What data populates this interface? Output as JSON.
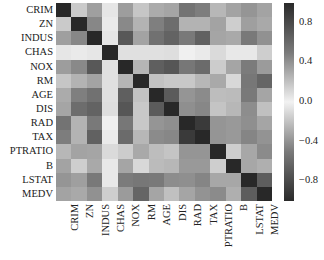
{
  "chart_data": {
    "type": "heatmap",
    "title": "",
    "xlabel": "",
    "ylabel": "",
    "labels": [
      "CRIM",
      "ZN",
      "INDUS",
      "CHAS",
      "NOX",
      "RM",
      "AGE",
      "DIS",
      "RAD",
      "TAX",
      "PTRATIO",
      "B",
      "LSTAT",
      "MEDV"
    ],
    "matrix": [
      [
        1.0,
        -0.2,
        0.41,
        -0.06,
        0.42,
        -0.22,
        0.35,
        -0.38,
        0.63,
        0.58,
        0.29,
        -0.39,
        0.46,
        -0.39
      ],
      [
        -0.2,
        1.0,
        -0.53,
        -0.04,
        -0.52,
        0.31,
        -0.57,
        0.66,
        -0.31,
        -0.31,
        -0.39,
        0.18,
        -0.41,
        0.36
      ],
      [
        0.41,
        -0.53,
        1.0,
        0.06,
        0.76,
        -0.39,
        0.64,
        -0.71,
        0.6,
        0.72,
        0.38,
        -0.36,
        0.6,
        -0.48
      ],
      [
        -0.06,
        -0.04,
        0.06,
        1.0,
        0.09,
        0.09,
        0.09,
        -0.1,
        -0.01,
        -0.04,
        -0.12,
        0.05,
        -0.05,
        0.18
      ],
      [
        0.42,
        -0.52,
        0.76,
        0.09,
        1.0,
        -0.3,
        0.73,
        -0.77,
        0.61,
        0.67,
        0.19,
        -0.38,
        0.59,
        -0.43
      ],
      [
        -0.22,
        0.31,
        -0.39,
        0.09,
        -0.3,
        1.0,
        -0.24,
        0.21,
        -0.21,
        -0.29,
        -0.36,
        0.13,
        -0.61,
        0.7
      ],
      [
        0.35,
        -0.57,
        0.64,
        0.09,
        0.73,
        -0.24,
        1.0,
        -0.75,
        0.46,
        0.51,
        0.26,
        -0.27,
        0.6,
        -0.38
      ],
      [
        -0.38,
        0.66,
        -0.71,
        -0.1,
        -0.77,
        0.21,
        -0.75,
        1.0,
        -0.49,
        -0.53,
        -0.23,
        0.29,
        -0.5,
        0.25
      ],
      [
        0.63,
        -0.31,
        0.6,
        -0.01,
        0.61,
        -0.21,
        0.46,
        -0.49,
        1.0,
        0.91,
        0.46,
        -0.44,
        0.49,
        -0.38
      ],
      [
        0.58,
        -0.31,
        0.72,
        -0.04,
        0.67,
        -0.29,
        0.51,
        -0.53,
        0.91,
        1.0,
        0.46,
        -0.44,
        0.54,
        -0.47
      ],
      [
        0.29,
        -0.39,
        0.38,
        -0.12,
        0.19,
        -0.36,
        0.26,
        -0.23,
        0.46,
        0.46,
        1.0,
        -0.18,
        0.37,
        -0.51
      ],
      [
        -0.39,
        0.18,
        -0.36,
        0.05,
        -0.38,
        0.13,
        -0.27,
        0.29,
        -0.44,
        -0.44,
        -0.18,
        1.0,
        -0.37,
        0.33
      ],
      [
        0.46,
        -0.41,
        0.6,
        -0.05,
        0.59,
        -0.61,
        0.6,
        -0.5,
        0.49,
        0.54,
        0.37,
        -0.37,
        1.0,
        -0.74
      ],
      [
        -0.39,
        0.36,
        -0.48,
        0.18,
        -0.43,
        0.7,
        -0.38,
        0.25,
        -0.38,
        -0.47,
        -0.51,
        0.33,
        -0.74,
        1.0
      ]
    ],
    "colorbar": {
      "ticks": [
        "0.8",
        "0.4",
        "0.0",
        "−0.4",
        "−0.8"
      ],
      "tick_values": [
        0.8,
        0.4,
        0.0,
        -0.4,
        -0.8
      ],
      "range": [
        -1.0,
        1.0
      ],
      "colormap": "diverging grayscale (dark at both extremes, light at 0)"
    },
    "grid": false,
    "legend_position": "right (colorbar)"
  }
}
